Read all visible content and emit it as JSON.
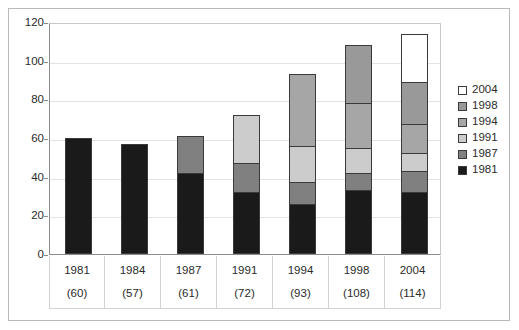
{
  "chart_data": {
    "type": "bar",
    "subtype": "stacked-bar",
    "title": "",
    "xlabel": "",
    "ylabel": "",
    "ylim": [
      0,
      120
    ],
    "yticks": [
      0,
      20,
      40,
      60,
      80,
      100,
      120
    ],
    "grid": true,
    "legend_position": "right",
    "categories": [
      "1981",
      "1984",
      "1987",
      "1991",
      "1994",
      "1998",
      "2004"
    ],
    "category_totals": [
      60,
      57,
      61,
      72,
      93,
      108,
      114
    ],
    "category_total_labels": [
      "(60)",
      "(57)",
      "(61)",
      "(72)",
      "(93)",
      "(108)",
      "(114)"
    ],
    "series": [
      {
        "name": "1981",
        "color": "#1a1a1a",
        "values": [
          60,
          57,
          42,
          32,
          26,
          33,
          32
        ]
      },
      {
        "name": "1987",
        "color": "#808080",
        "values": [
          0,
          0,
          19,
          15,
          11,
          9,
          11
        ]
      },
      {
        "name": "1991",
        "color": "#cccccc",
        "values": [
          0,
          0,
          0,
          25,
          19,
          13,
          9
        ]
      },
      {
        "name": "1994",
        "color": "#a6a6a6",
        "values": [
          0,
          0,
          0,
          0,
          37,
          23,
          15
        ]
      },
      {
        "name": "1998",
        "color": "#999999",
        "values": [
          0,
          0,
          0,
          0,
          0,
          30,
          22
        ]
      },
      {
        "name": "2004",
        "color": "#ffffff",
        "values": [
          0,
          0,
          0,
          0,
          0,
          0,
          25
        ]
      }
    ],
    "legend_entries": [
      {
        "label": "2004",
        "color": "#ffffff"
      },
      {
        "label": "1998",
        "color": "#999999"
      },
      {
        "label": "1994",
        "color": "#a6a6a6"
      },
      {
        "label": "1991",
        "color": "#cccccc"
      },
      {
        "label": "1987",
        "color": "#808080"
      },
      {
        "label": "1981",
        "color": "#1a1a1a"
      }
    ]
  }
}
